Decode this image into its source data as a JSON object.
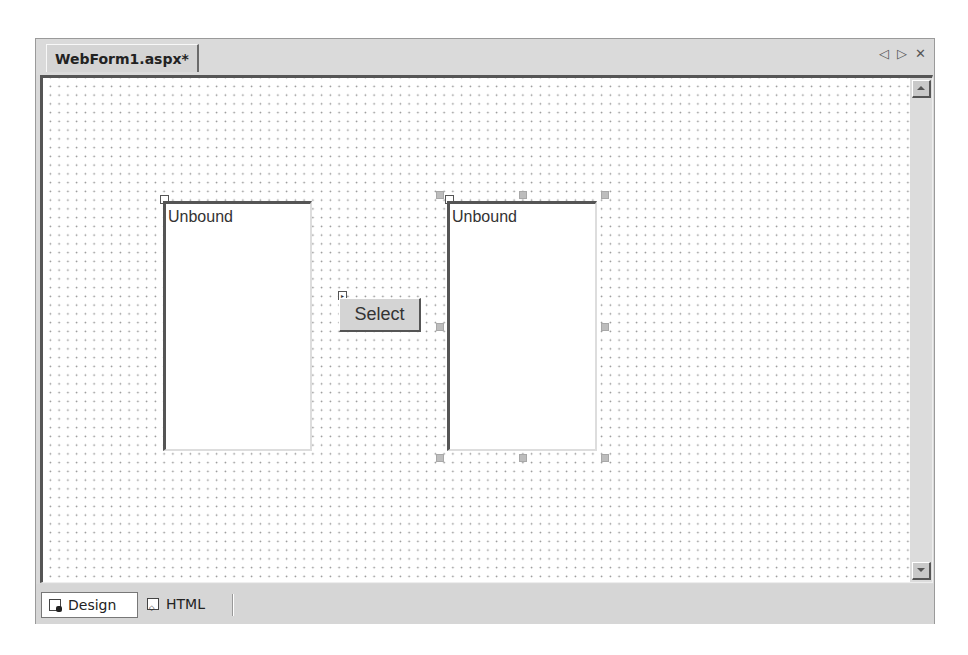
{
  "document_tab": {
    "title": "WebForm1.aspx*"
  },
  "tab_controls": {
    "prev": "◁",
    "next": "▷",
    "close": "✕"
  },
  "design_surface": {
    "listbox_left": {
      "text": "Unbound"
    },
    "select_button": {
      "label": "Select"
    },
    "listbox_right": {
      "text": "Unbound",
      "selected": true
    }
  },
  "view_tabs": [
    {
      "label": "Design",
      "active": true,
      "icon": "design-view-icon"
    },
    {
      "label": "HTML",
      "active": false,
      "icon": "html-view-icon"
    }
  ]
}
